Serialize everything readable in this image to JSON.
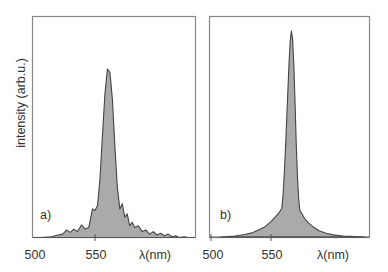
{
  "chart_data": [
    {
      "type": "area",
      "panel_label": "a)",
      "title": "",
      "xlabel": "λ(nm)",
      "ylabel": "intensity (arb.u.)",
      "xlim": [
        500,
        631
      ],
      "ylim": [
        0,
        1.05
      ],
      "x_ticks": [
        500,
        550
      ],
      "x_tick_labels": [
        "500",
        "550"
      ],
      "grid": false,
      "legend": null,
      "fill_color": "#aaaaaa",
      "line_color": "#444444",
      "series": [
        {
          "name": "spectrum a",
          "x": [
            506,
            515,
            520,
            524,
            527,
            530,
            533,
            536,
            539,
            542,
            545,
            548,
            550,
            552,
            554,
            556,
            558,
            560,
            562,
            564,
            566,
            568,
            570,
            572,
            574,
            576,
            578,
            580,
            582,
            585,
            588,
            591,
            594,
            597,
            600,
            603,
            606,
            609,
            612,
            615,
            618,
            622,
            625
          ],
          "values": [
            0.0,
            0.005,
            0.015,
            0.02,
            0.045,
            0.03,
            0.05,
            0.035,
            0.075,
            0.05,
            0.06,
            0.17,
            0.16,
            0.19,
            0.35,
            0.6,
            0.85,
            1.0,
            0.98,
            0.82,
            0.55,
            0.3,
            0.17,
            0.2,
            0.12,
            0.14,
            0.07,
            0.09,
            0.06,
            0.07,
            0.035,
            0.045,
            0.02,
            0.035,
            0.015,
            0.025,
            0.01,
            0.02,
            0.005,
            0.01,
            0.0,
            0.005,
            0.0
          ]
        }
      ]
    },
    {
      "type": "area",
      "panel_label": "b)",
      "title": "",
      "xlabel": "λ(nm)",
      "ylabel": "",
      "xlim": [
        500,
        633
      ],
      "ylim": [
        0,
        1.05
      ],
      "x_ticks": [
        500,
        550
      ],
      "x_tick_labels": [
        "500",
        "550"
      ],
      "grid": false,
      "legend": null,
      "fill_color": "#aaaaaa",
      "line_color": "#444444",
      "series": [
        {
          "name": "spectrum b",
          "x": [
            508,
            520,
            528,
            534,
            540,
            545,
            550,
            554,
            557,
            559,
            560,
            561,
            562,
            563,
            564,
            565,
            566,
            567,
            568,
            569,
            570,
            571,
            572,
            573,
            574,
            576,
            578,
            581,
            585,
            590,
            596,
            602,
            610,
            620,
            628
          ],
          "values": [
            0.0,
            0.005,
            0.012,
            0.02,
            0.035,
            0.05,
            0.075,
            0.1,
            0.12,
            0.14,
            0.2,
            0.3,
            0.42,
            0.56,
            0.7,
            0.84,
            0.95,
            1.0,
            0.96,
            0.84,
            0.66,
            0.46,
            0.3,
            0.19,
            0.13,
            0.11,
            0.09,
            0.07,
            0.05,
            0.03,
            0.018,
            0.01,
            0.005,
            0.002,
            0.0
          ]
        }
      ]
    }
  ],
  "panels": {
    "a": {
      "label": "a)",
      "tick_500": "500",
      "tick_550": "550",
      "xlabel": "λ(nm)",
      "ylabel": "intensity (arb.u.)"
    },
    "b": {
      "label": "b)",
      "tick_500": "500",
      "tick_550": "550",
      "xlabel": "λ(nm)"
    }
  }
}
